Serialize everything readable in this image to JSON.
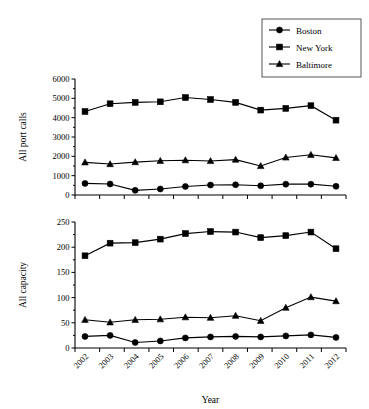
{
  "figure": {
    "background": "#ffffff",
    "ink_color": "#000000"
  },
  "legend": {
    "position": "top-right",
    "entries": [
      {
        "label": "Boston",
        "marker": "circle"
      },
      {
        "label": "New York",
        "marker": "square"
      },
      {
        "label": "Baltimore",
        "marker": "triangle"
      }
    ]
  },
  "chart_data": [
    {
      "type": "line",
      "title": "",
      "xlabel": "",
      "ylabel": "All port calls",
      "x": [
        2002,
        2003,
        2004,
        2005,
        2006,
        2007,
        2008,
        2009,
        2010,
        2011,
        2012
      ],
      "xticklabels": [
        "2002",
        "2003",
        "2004",
        "2005",
        "2006",
        "2007",
        "2008",
        "2009",
        "2010",
        "2011",
        "2012"
      ],
      "yticklabels": [
        "0",
        "1000",
        "2000",
        "3000",
        "4000",
        "5000",
        "6000"
      ],
      "yticks": [
        0,
        1000,
        2000,
        3000,
        4000,
        5000,
        6000
      ],
      "ylim": [
        0,
        6000
      ],
      "xlim": [
        2001.5,
        2012.5
      ],
      "grid": false,
      "series": [
        {
          "name": "Boston",
          "marker": "circle",
          "values": [
            600,
            570,
            240,
            310,
            440,
            515,
            530,
            480,
            560,
            560,
            450
          ]
        },
        {
          "name": "New York",
          "marker": "square",
          "values": [
            4320,
            4720,
            4790,
            4820,
            5040,
            4940,
            4790,
            4390,
            4480,
            4620,
            3870
          ]
        },
        {
          "name": "Baltimore",
          "marker": "triangle",
          "values": [
            1690,
            1600,
            1700,
            1770,
            1800,
            1760,
            1830,
            1500,
            1940,
            2080,
            1920
          ]
        }
      ]
    },
    {
      "type": "line",
      "title": "",
      "xlabel": "Year",
      "ylabel": "All capacity",
      "x": [
        2002,
        2003,
        2004,
        2005,
        2006,
        2007,
        2008,
        2009,
        2010,
        2011,
        2012
      ],
      "xticklabels": [
        "2002",
        "2003",
        "2004",
        "2005",
        "2006",
        "2007",
        "2008",
        "2009",
        "2010",
        "2011",
        "2012"
      ],
      "yticklabels": [
        "0",
        "50",
        "100",
        "150",
        "200",
        "250"
      ],
      "yticks": [
        0,
        50,
        100,
        150,
        200,
        250
      ],
      "ylim": [
        0,
        250
      ],
      "xlim": [
        2001.5,
        2012.5
      ],
      "grid": false,
      "series": [
        {
          "name": "Boston",
          "marker": "circle",
          "values": [
            23,
            25,
            11,
            14,
            20,
            22,
            23,
            22,
            24,
            26,
            21
          ]
        },
        {
          "name": "New York",
          "marker": "square",
          "values": [
            183,
            208,
            209,
            216,
            227,
            231,
            230,
            219,
            223,
            230,
            197
          ]
        },
        {
          "name": "Baltimore",
          "marker": "triangle",
          "values": [
            56,
            51,
            56,
            57,
            61,
            60,
            64,
            54,
            80,
            101,
            93
          ]
        }
      ]
    }
  ]
}
